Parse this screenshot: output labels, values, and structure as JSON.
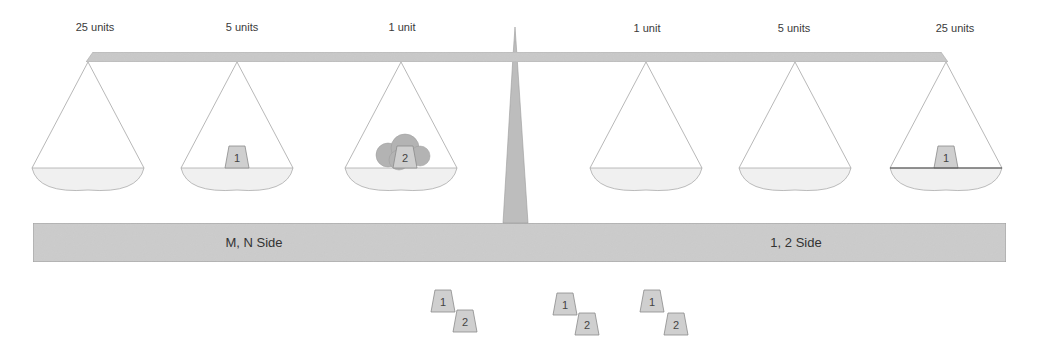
{
  "diagram": {
    "title": "",
    "colors": {
      "beam": "#c9c9c9",
      "post": "#bdbdbd",
      "base": "#cccccc",
      "pan_fill": "#f0f0f0",
      "string": "#9a9a9a",
      "weight_fill": "#cfcfcf",
      "weight_stroke": "#8a8a8a",
      "blob_fill": "#b3b3b3",
      "text": "#3a3a3a"
    },
    "beam_labels": [
      {
        "id": "left-25",
        "text": "25 units",
        "x": 95
      },
      {
        "id": "left-5",
        "text": "5 units",
        "x": 242
      },
      {
        "id": "left-1",
        "text": "1 unit",
        "x": 402
      },
      {
        "id": "right-1",
        "text": "1 unit",
        "x": 647
      },
      {
        "id": "right-5",
        "text": "5 units",
        "x": 794
      },
      {
        "id": "right-25",
        "text": "25 units",
        "x": 955
      }
    ],
    "base": {
      "left_label": "M, N Side",
      "right_label": "1, 2 Side"
    },
    "pans": [
      {
        "id": "pan-left-25",
        "hang_x": 88,
        "contents": []
      },
      {
        "id": "pan-left-5",
        "hang_x": 237,
        "contents": [
          {
            "type": "weight",
            "label": "1"
          }
        ]
      },
      {
        "id": "pan-left-1",
        "hang_x": 401,
        "contents": [
          {
            "type": "blob"
          },
          {
            "type": "weight",
            "label": "2"
          }
        ]
      },
      {
        "id": "pan-right-1",
        "hang_x": 646,
        "contents": []
      },
      {
        "id": "pan-right-5",
        "hang_x": 795,
        "contents": []
      },
      {
        "id": "pan-right-25",
        "hang_x": 946,
        "contents": [
          {
            "type": "weight",
            "label": "1"
          }
        ]
      }
    ],
    "loose_weight_pairs": [
      {
        "id": "pair-1",
        "w1": {
          "label": "1",
          "x": 443,
          "y": 292
        },
        "w2": {
          "label": "2",
          "x": 465,
          "y": 310
        }
      },
      {
        "id": "pair-2",
        "w1": {
          "label": "1",
          "x": 565,
          "y": 295
        },
        "w2": {
          "label": "2",
          "x": 587,
          "y": 313
        }
      },
      {
        "id": "pair-3",
        "w1": {
          "label": "1",
          "x": 652,
          "y": 292
        },
        "w2": {
          "label": "2",
          "x": 676,
          "y": 313
        }
      }
    ]
  }
}
